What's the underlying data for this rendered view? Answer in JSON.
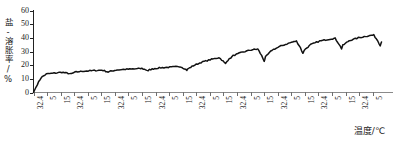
{
  "chart_data": {
    "type": "line",
    "title": "",
    "xlabel": "温度/℃",
    "ylabel": "盐-溶胀率/%",
    "ylim": [
      0,
      60
    ],
    "yticks": [
      0,
      10,
      20,
      30,
      40,
      50,
      60
    ],
    "ytick_labels": [
      "0",
      "10",
      "20",
      "30",
      "40",
      "50",
      "60"
    ],
    "grid": false,
    "legend": null,
    "xtick_labels": [
      "32.4",
      "5",
      "15",
      "32.4",
      "5",
      "15",
      "32.4",
      "5",
      "15",
      "32.4",
      "5",
      "15",
      "32.4",
      "5",
      "15",
      "32.4",
      "5",
      "15",
      "32.4",
      "5",
      "15",
      "32.4",
      "5",
      "15",
      "32.4",
      "5"
    ],
    "cycle_pattern": [
      "32.4",
      "5",
      "15"
    ],
    "series": [
      {
        "name": "盐-溶胀率",
        "x": [
          0,
          0.3,
          0.6,
          1.0,
          1.6,
          2.2,
          2.6,
          2.9,
          3.0,
          3.3,
          3.9,
          4.6,
          5.3,
          5.6,
          5.8,
          6.0,
          6.4,
          7.0,
          7.7,
          8.4,
          8.7,
          8.9,
          9.0,
          9.4,
          10.0,
          10.7,
          11.4,
          11.7,
          11.9,
          12.0,
          12.4,
          13.0,
          13.7,
          14.4,
          14.7,
          14.9,
          15.0,
          15.5,
          16.2,
          16.9,
          17.4,
          17.7,
          17.9,
          18.0,
          18.5,
          19.2,
          19.9,
          20.4,
          20.7,
          20.9,
          21.0,
          21.5,
          22.2,
          22.9,
          23.4,
          23.7,
          23.9,
          24.0,
          24.5,
          25.2,
          25.9,
          26.4,
          26.7,
          26.9,
          27.0
        ],
        "y": [
          0,
          6,
          11,
          13.5,
          14.2,
          14.8,
          14.2,
          13.6,
          14.0,
          15.0,
          15.6,
          16.0,
          16.4,
          15.6,
          15.0,
          15.6,
          16.4,
          16.9,
          17.2,
          17.6,
          16.7,
          16.0,
          16.6,
          17.6,
          18.2,
          18.6,
          19.0,
          17.6,
          16.4,
          17.4,
          19.6,
          22.0,
          24.0,
          25.6,
          23.0,
          21.0,
          23.0,
          27.0,
          29.5,
          31.2,
          31.8,
          27.0,
          23.0,
          26.0,
          31.0,
          34.0,
          36.4,
          37.6,
          33.0,
          28.5,
          31.0,
          35.0,
          37.6,
          39.0,
          39.6,
          35.5,
          32.0,
          34.5,
          38.0,
          40.0,
          41.4,
          42.0,
          38.0,
          34.5,
          37.0
        ],
        "y_unit": "%",
        "x_unit": "°C",
        "start_value": 0,
        "plateau_value": 50,
        "description": "阶梯式锯齿上升曲线，随热循环次数增加溶胀率由0%升至约50%"
      }
    ],
    "num_cycles": 9,
    "y_start": 0,
    "y_end": 50
  },
  "axis": {
    "y_title": "盐-溶胀率/%",
    "x_title": "温度/℃"
  }
}
